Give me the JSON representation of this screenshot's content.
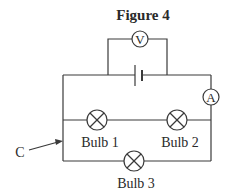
{
  "figure": {
    "title": "Figure 4",
    "components": {
      "voltmeter": {
        "symbol": "V",
        "description": "voltmeter connected in parallel across the cell"
      },
      "ammeter": {
        "symbol": "A",
        "description": "ammeter on right side of circuit"
      },
      "cell": {
        "description": "single cell (battery) in top wire"
      },
      "bulbs": [
        {
          "label": "Bulb 1"
        },
        {
          "label": "Bulb 2"
        },
        {
          "label": "Bulb 3"
        }
      ],
      "pointer": {
        "label": "C",
        "description": "arrow pointing to junction on left wire"
      }
    },
    "colors": {
      "line": "#3a3a3a",
      "text": "#2a2a2a",
      "background": "#ffffff"
    }
  }
}
